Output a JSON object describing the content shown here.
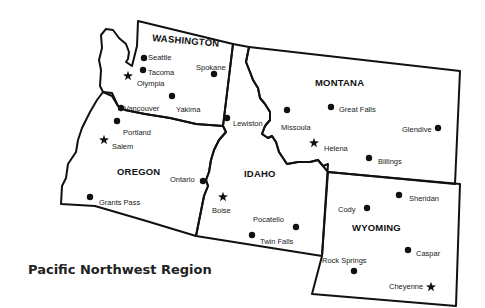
{
  "title": "Pacific Northwest Region",
  "states": [
    {
      "name": "WASHINGTON",
      "x": 152,
      "y": 41,
      "rotate": 5
    },
    {
      "name": "OREGON",
      "x": 117,
      "y": 175,
      "rotate": 0
    },
    {
      "name": "IDAHO",
      "x": 244,
      "y": 177,
      "rotate": 0
    },
    {
      "name": "MONTANA",
      "x": 315,
      "y": 86,
      "rotate": 0
    },
    {
      "name": "WYOMING",
      "x": 352,
      "y": 231,
      "rotate": 0
    }
  ],
  "cities": [
    {
      "name": "Seattle",
      "marker": "dot",
      "mx": 144,
      "my": 58,
      "lx": 148,
      "ly": 57
    },
    {
      "name": "Tacoma",
      "marker": "dot",
      "mx": 143,
      "my": 70,
      "lx": 148,
      "ly": 72
    },
    {
      "name": "Olympia",
      "marker": "star",
      "mx": 128,
      "my": 76,
      "lx": 137,
      "ly": 83
    },
    {
      "name": "Spokane",
      "marker": "dot",
      "mx": 214,
      "my": 74,
      "lx": 196,
      "ly": 67
    },
    {
      "name": "Yakima",
      "marker": "dot",
      "mx": 172,
      "my": 96,
      "lx": 176,
      "ly": 109
    },
    {
      "name": "Vancouver",
      "marker": "dot",
      "mx": 121,
      "my": 108,
      "lx": 124,
      "ly": 108
    },
    {
      "name": "Portland",
      "marker": "dot",
      "mx": 117,
      "my": 121,
      "lx": 123,
      "ly": 132
    },
    {
      "name": "Salem",
      "marker": "star",
      "mx": 104,
      "my": 140,
      "lx": 112,
      "ly": 146
    },
    {
      "name": "Lewiston",
      "marker": "dot",
      "mx": 227,
      "my": 118,
      "lx": 233,
      "ly": 123
    },
    {
      "name": "Ontario",
      "marker": "dot",
      "mx": 203,
      "my": 181,
      "lx": 170,
      "ly": 179
    },
    {
      "name": "Grants Pass",
      "marker": "dot",
      "mx": 90,
      "my": 197,
      "lx": 99,
      "ly": 202
    },
    {
      "name": "Boise",
      "marker": "star",
      "mx": 223,
      "my": 197,
      "lx": 212,
      "ly": 210
    },
    {
      "name": "Pocatello",
      "marker": "dot",
      "mx": 296,
      "my": 227,
      "lx": 253,
      "ly": 219
    },
    {
      "name": "Twin Falls",
      "marker": "dot",
      "mx": 252,
      "my": 235,
      "lx": 260,
      "ly": 241
    },
    {
      "name": "Missoula",
      "marker": "dot",
      "mx": 287,
      "my": 110,
      "lx": 281,
      "ly": 127
    },
    {
      "name": "Great Falls",
      "marker": "dot",
      "mx": 331,
      "my": 107,
      "lx": 339,
      "ly": 109
    },
    {
      "name": "Helena",
      "marker": "star",
      "mx": 314,
      "my": 143,
      "lx": 324,
      "ly": 148
    },
    {
      "name": "Glendive",
      "marker": "dot",
      "mx": 438,
      "my": 128,
      "lx": 402,
      "ly": 129
    },
    {
      "name": "Billings",
      "marker": "dot",
      "mx": 369,
      "my": 158,
      "lx": 378,
      "ly": 161
    },
    {
      "name": "Sheridan",
      "marker": "dot",
      "mx": 399,
      "my": 195,
      "lx": 409,
      "ly": 198
    },
    {
      "name": "Cody",
      "marker": "dot",
      "mx": 367,
      "my": 208,
      "lx": 338,
      "ly": 209
    },
    {
      "name": "Caspar",
      "marker": "dot",
      "mx": 408,
      "my": 250,
      "lx": 416,
      "ly": 253
    },
    {
      "name": "Rock Springs",
      "marker": "dot",
      "mx": 354,
      "my": 271,
      "lx": 322,
      "ly": 260
    },
    {
      "name": "Cheyenne",
      "marker": "star",
      "mx": 431,
      "my": 287,
      "lx": 389,
      "ly": 286
    }
  ]
}
